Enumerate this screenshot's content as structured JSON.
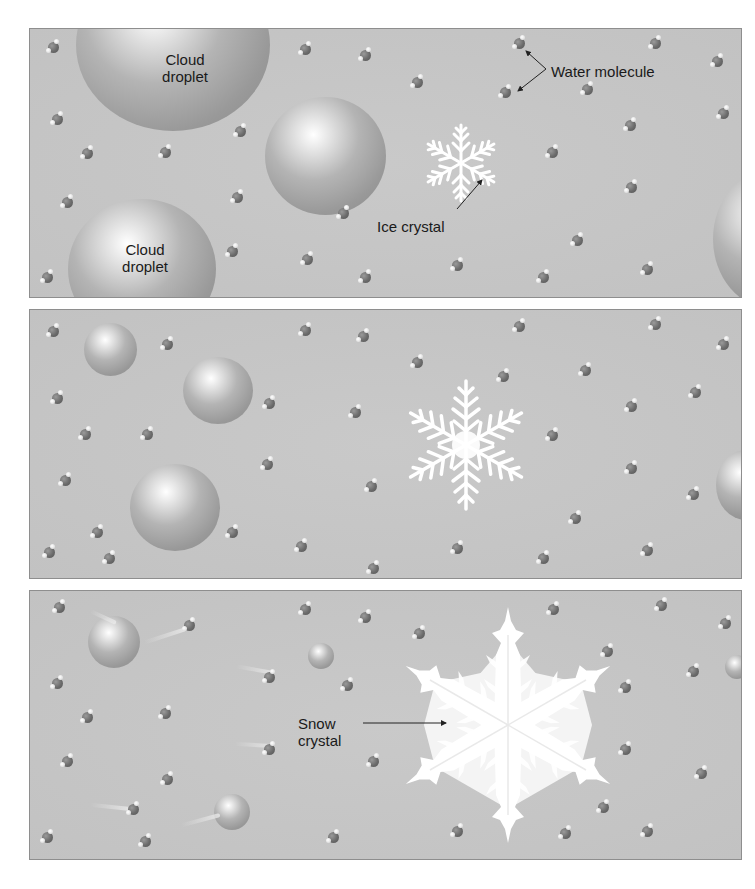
{
  "figure": {
    "panels": [
      {
        "id": "panel-1",
        "labels": {
          "cloud_droplet_1": "Cloud\ndroplet",
          "cloud_droplet_2": "Cloud\ndroplet",
          "water_molecule": "Water molecule",
          "ice_crystal": "Ice crystal"
        }
      },
      {
        "id": "panel-2",
        "labels": {}
      },
      {
        "id": "panel-3",
        "labels": {
          "snow_crystal": "Snow\ncrystal"
        }
      }
    ],
    "colors": {
      "background": "#ffffff",
      "panel_fill": "#c4c4c4",
      "panel_border": "#8e8e8e",
      "droplet": "#a8a8a8",
      "crystal": "#ffffff",
      "molecule": "#6b6b6b",
      "text": "#1a1a1a"
    }
  }
}
